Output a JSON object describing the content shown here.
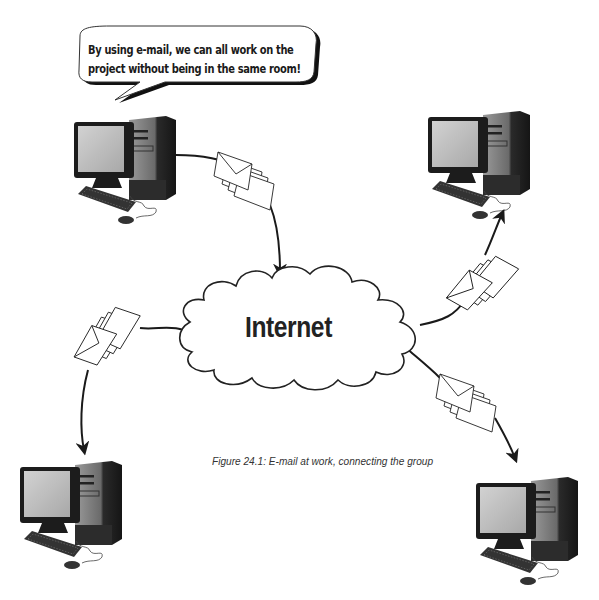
{
  "figure": {
    "speech_bubble": {
      "line1": "By using e-mail, we can all work on the",
      "line2": "project without being in the same room!"
    },
    "cloud": {
      "label": "Internet"
    },
    "caption": "Figure 24.1: E-mail at work, connecting the group",
    "nodes": [
      {
        "name": "computer-top-left",
        "role": "sender"
      },
      {
        "name": "computer-top-right",
        "role": "recipient"
      },
      {
        "name": "computer-bottom-left",
        "role": "recipient"
      },
      {
        "name": "computer-bottom-right",
        "role": "recipient"
      }
    ],
    "icons": {
      "computer": "desktop-computer-icon",
      "envelopes": "envelope-stack-icon",
      "cloud": "cloud-icon",
      "arrow": "arrow-icon"
    },
    "colors": {
      "background": "#ffffff",
      "stroke": "#222222",
      "screen": "#c8c8c8",
      "case": "#3a3a3a"
    }
  }
}
